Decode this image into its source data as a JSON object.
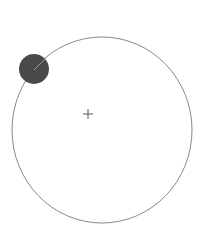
{
  "diagram": {
    "canvas": {
      "width": 203,
      "height": 239,
      "background": "#ffffff"
    },
    "orbit_circle": {
      "cx": 102,
      "cy": 130,
      "rx": 90,
      "ry": 93,
      "stroke": "#8a8a8a",
      "stroke_width": 1
    },
    "center_marker": {
      "x": 88,
      "y": 114,
      "size": 5,
      "stroke": "#555555",
      "icon": "plus-crosshair"
    },
    "handle_circle": {
      "cx": 34,
      "cy": 69,
      "r": 15,
      "fill": "#4a4a4a"
    },
    "handle_radius_line": {
      "x1": 34,
      "y1": 70,
      "x2": 46,
      "y2": 58,
      "stroke": "#9a9a9a"
    }
  }
}
